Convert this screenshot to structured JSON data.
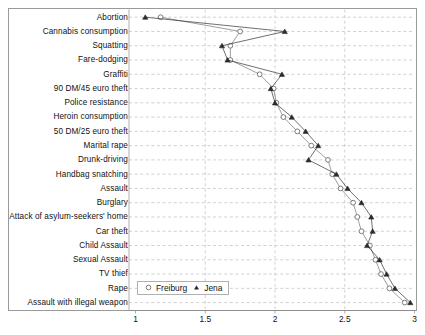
{
  "chart_data": {
    "type": "line",
    "title": "",
    "xlabel": "",
    "ylabel": "",
    "orientation": "horizontal",
    "grid": true,
    "xlim": [
      1,
      3
    ],
    "xticks": [
      1,
      1.5,
      2,
      2.5,
      3
    ],
    "xtick_labels": [
      "1",
      "1.5",
      "2",
      "2.5",
      "3"
    ],
    "legend_position": "bottom-left",
    "categories": [
      "Abortion",
      "Cannabis consumption",
      "Squatting",
      "Fare-dodging",
      "Graffiti",
      "90 DM/45 euro theft",
      "Police resistance",
      "Heroin consumption",
      "50 DM/25 euro theft",
      "Marital rape",
      "Drunk-driving",
      "Handbag snatching",
      "Assault",
      "Burglary",
      "Attack of asylum-seekers' home",
      "Car theft",
      "Child Assault",
      "Sexual Assault",
      "TV thief",
      "Rape",
      "Assault with illegal weapon"
    ],
    "series": [
      {
        "name": "Freiburg",
        "marker": "open-circle",
        "color": "#6e6e6e",
        "values": [
          1.18,
          1.75,
          1.68,
          1.68,
          1.89,
          1.99,
          2.01,
          2.06,
          2.16,
          2.26,
          2.38,
          2.41,
          2.47,
          2.56,
          2.59,
          2.62,
          2.68,
          2.72,
          2.76,
          2.82,
          2.93
        ]
      },
      {
        "name": "Jena",
        "marker": "filled-triangle",
        "color": "#2b2b2b",
        "values": [
          1.07,
          2.07,
          1.62,
          1.66,
          2.05,
          1.97,
          2.0,
          2.12,
          2.22,
          2.31,
          2.24,
          2.44,
          2.52,
          2.62,
          2.69,
          2.7,
          2.66,
          2.75,
          2.8,
          2.86,
          2.97
        ]
      }
    ]
  },
  "legend": {
    "items": [
      {
        "label": "Freiburg",
        "marker": "open-circle"
      },
      {
        "label": "Jena",
        "marker": "filled-triangle"
      }
    ]
  }
}
